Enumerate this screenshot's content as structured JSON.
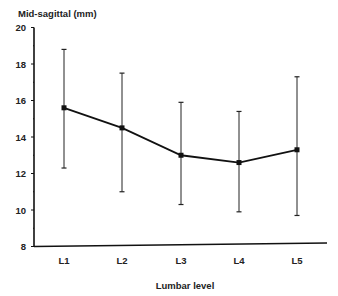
{
  "chart_data": {
    "type": "line",
    "title": "",
    "ylabel": "Mid-sagittal (mm)",
    "xlabel": "Lumbar level",
    "categories": [
      "L1",
      "L2",
      "L3",
      "L4",
      "L5"
    ],
    "series": [
      {
        "name": "Mid-sagittal diameter",
        "values": [
          15.6,
          14.5,
          13.0,
          12.6,
          13.3
        ],
        "error_upper": [
          18.8,
          17.5,
          15.9,
          15.4,
          17.3
        ],
        "error_lower": [
          12.3,
          11.0,
          10.3,
          9.9,
          9.7
        ]
      }
    ],
    "ylim": [
      8,
      20
    ],
    "yticks": [
      8,
      10,
      12,
      14,
      16,
      18,
      20
    ],
    "grid": false,
    "legend": "none"
  }
}
